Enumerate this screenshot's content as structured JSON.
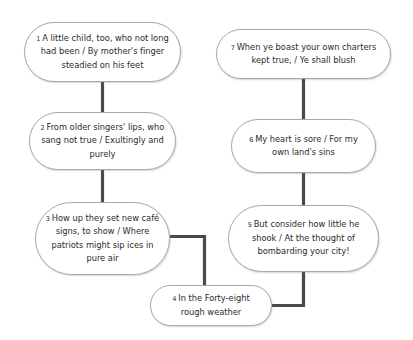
{
  "diagram": {
    "background_color": "#ffffff",
    "node_fill_color": "#ffffff",
    "node_border_color": "#a8a8a8",
    "connector_color": "#4a4a4a",
    "text_color": "#2b2b2b"
  },
  "nodes": [
    {
      "id": "node-1",
      "number": "1",
      "text": "A little child, too, who not long had been / By mother's finger steadied on his feet",
      "lines": [
        "A little child, too, who not",
        "long had been / By mother's",
        "finger steadied on his feet"
      ]
    },
    {
      "id": "node-2",
      "number": "2",
      "text": "From older singers' lips, who sang not true / Exultingly and purely",
      "lines": [
        "From older singers' lips,",
        "who sang not true /",
        "Exultingly and purely"
      ]
    },
    {
      "id": "node-3",
      "number": "3",
      "text": "How up they set new café signs, to show / Where patriots might sip ices in pure air",
      "lines": [
        "How up they set new",
        "café signs, to show /",
        "Where patriots might",
        "sip ices in pure air"
      ]
    },
    {
      "id": "node-4",
      "number": "4",
      "text": "In the Forty-eight rough weather",
      "lines": [
        "In the Forty-eight",
        "rough weather"
      ]
    },
    {
      "id": "node-5",
      "number": "5",
      "text": "But consider how little he shook / At the thought of bombarding your city!",
      "lines": [
        "But consider how little he",
        "shook / At the thought of",
        "bombarding your city!"
      ]
    },
    {
      "id": "node-6",
      "number": "6",
      "text": "My heart is sore / For my own land's sins",
      "lines": [
        "My heart is sore / For my",
        "own land's sins"
      ]
    },
    {
      "id": "node-7",
      "number": "7",
      "text": "When ye boast your own charters kept true, / Ye shall blush",
      "lines": [
        "When ye boast your own charters",
        "kept true, / Ye shall blush"
      ]
    }
  ],
  "edges": [
    {
      "id": "edge-1-2",
      "from": "1",
      "to": "2"
    },
    {
      "id": "edge-2-3",
      "from": "2",
      "to": "3"
    },
    {
      "id": "edge-3-4",
      "from": "3",
      "to": "4"
    },
    {
      "id": "edge-4-5",
      "from": "4",
      "to": "5"
    },
    {
      "id": "edge-5-6",
      "from": "5",
      "to": "6"
    },
    {
      "id": "edge-6-7",
      "from": "6",
      "to": "7"
    }
  ]
}
